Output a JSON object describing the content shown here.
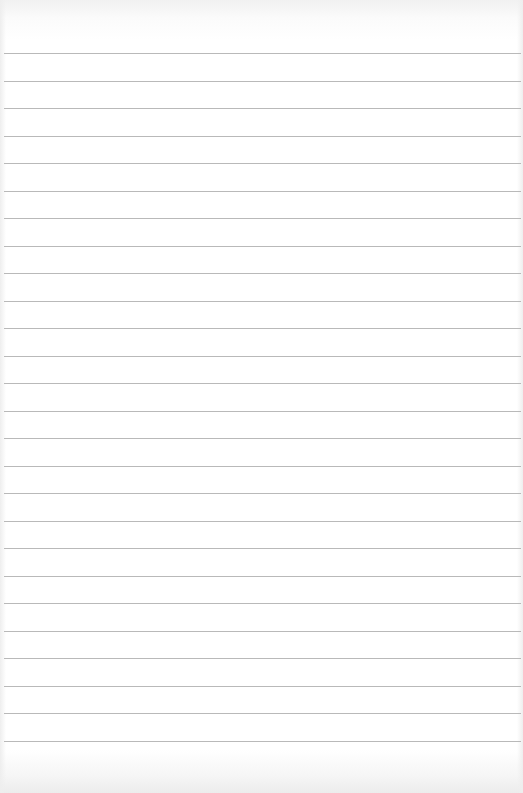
{
  "paper": {
    "type": "lined-paper",
    "background_color": "#ffffff",
    "line_color": "#b9b9b9",
    "line_count": 26,
    "first_line_y": 53,
    "line_spacing_px": 27.5,
    "text": ""
  }
}
